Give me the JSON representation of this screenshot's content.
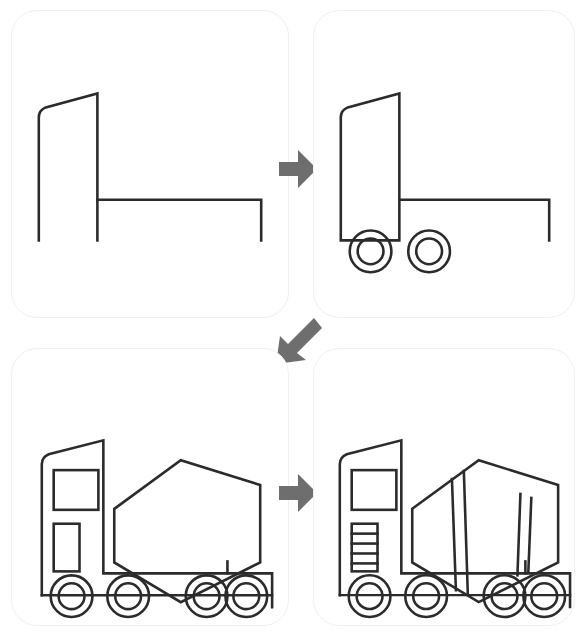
{
  "sheet": {
    "title": "How to draw a cement mixer truck - 4 step tutorial",
    "background_color": "#ffffff",
    "width": 585,
    "height": 633
  },
  "style": {
    "ink_color": "#2b2b2b",
    "ink_width": 2.6,
    "panel_border_color": "#f0f0f0",
    "panel_fill": "#ffffff",
    "arrow_color": "#6e6e6e",
    "panel_radius": 26
  },
  "panels": [
    {
      "id": "step-1",
      "step_number": "1",
      "caption": "Draw the cab outline and the chassis line",
      "parts": [
        "cab-outline",
        "chassis-line"
      ]
    },
    {
      "id": "step-2",
      "step_number": "2",
      "caption": "Add the two front wheels under the cab",
      "parts": [
        "cab-outline",
        "chassis-line",
        "front-wheel",
        "second-wheel"
      ]
    },
    {
      "id": "step-3",
      "step_number": "3",
      "caption": "Add the hexagonal mixer drum, cab window, door and four wheels",
      "parts": [
        "cab-outline",
        "cab-window",
        "cab-door-panel",
        "mixer-drum-hexagon",
        "drum-support",
        "chassis-bed",
        "wheel-1",
        "wheel-2",
        "wheel-3",
        "wheel-4"
      ]
    },
    {
      "id": "step-4",
      "step_number": "4",
      "caption": "Finish with drum bands and the cab ladder steps",
      "parts": [
        "cab-outline",
        "cab-window",
        "cab-ladder",
        "mixer-drum-hexagon",
        "drum-band-left",
        "drum-band-right",
        "drum-facet-lines",
        "drum-support",
        "chassis-bed",
        "wheel-1",
        "wheel-2",
        "wheel-3",
        "wheel-4"
      ]
    }
  ],
  "arrows": [
    {
      "id": "arrow-step-1-to-2",
      "direction": "right",
      "from": "step-1",
      "to": "step-2"
    },
    {
      "id": "arrow-step-2-to-3",
      "direction": "down-left",
      "from": "step-2",
      "to": "step-3"
    },
    {
      "id": "arrow-step-3-to-4",
      "direction": "right",
      "from": "step-3",
      "to": "step-4"
    }
  ],
  "drawing_data": {
    "type": "line-drawing",
    "subject": "cement mixer truck",
    "wheel": {
      "outer_radius": 21,
      "inner_radius": 13
    },
    "step1": {
      "cab_path": "M 27,231 L 27,107 Q 27,100 34,97 L 86,83 L 86,231",
      "chassis_path": "M 86,190 L 251,190 L 251,231"
    },
    "step2": {
      "cab_path": "M 27,231 L 27,107 Q 27,100 34,97 L 86,83 L 86,231 L 27,231",
      "chassis_path": "M 86,190 L 237,190 L 237,231",
      "wheels": [
        {
          "cx": 57,
          "cy": 242
        },
        {
          "cx": 116,
          "cy": 242
        }
      ]
    },
    "step3": {
      "cab_path": "M 30,226 L 30,116 Q 30,109 37,106 L 92,92 L 92,226",
      "window_rect": {
        "x": 42,
        "y": 122,
        "w": 45,
        "h": 40
      },
      "door_rect": {
        "x": 42,
        "y": 176,
        "w": 26,
        "h": 48
      },
      "drum_hexagon": "M 103,161 L 170,112 L 250,137 L 250,215 L 170,255 L 103,215 Z",
      "drum_support": "M 217,214 L 217,238",
      "bed_path": "M 30,226 L 30,248 M 92,226 L 262,226 L 262,260",
      "bed_top": "M 92,226 L 262,226",
      "wheels": [
        {
          "cx": 60,
          "cy": 249
        },
        {
          "cx": 117,
          "cy": 249
        },
        {
          "cx": 196,
          "cy": 249
        },
        {
          "cx": 236,
          "cy": 249
        }
      ]
    },
    "step4": {
      "cab_path": "M 26,226 L 26,116 Q 26,109 33,106 L 88,92 L 88,226",
      "window_rect": {
        "x": 38,
        "y": 122,
        "w": 45,
        "h": 40
      },
      "ladder_rect": {
        "x": 38,
        "y": 176,
        "w": 26,
        "h": 48
      },
      "ladder_rungs": 4,
      "drum_hexagon": "M 99,161 L 166,112 L 246,137 L 246,215 L 166,255 L 99,215 Z",
      "drum_bands": [
        {
          "top_x": 139,
          "bottom_x": 143
        },
        {
          "top_x": 150,
          "bottom_x": 152
        },
        {
          "top_x": 208,
          "bottom_x": 206
        },
        {
          "top_x": 219,
          "bottom_x": 216
        }
      ],
      "drum_support": "M 213,214 L 213,238",
      "bed_top": "M 88,226 L 258,226",
      "wheels": [
        {
          "cx": 56,
          "cy": 249
        },
        {
          "cx": 113,
          "cy": 249
        },
        {
          "cx": 192,
          "cy": 249
        },
        {
          "cx": 232,
          "cy": 249
        }
      ]
    }
  }
}
